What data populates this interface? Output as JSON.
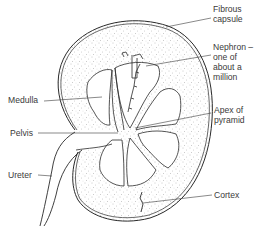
{
  "diagram": {
    "colors": {
      "line": "#2a2a2a",
      "stipple": "#8a8a8a",
      "text": "#3a3a3a",
      "background": "#ffffff"
    },
    "labels": {
      "fibrous_capsule": "Fibrous\ncapsule",
      "nephron": "Nephron –\none of\nabout a\nmillion",
      "medulla": "Medulla",
      "apex_of_pyramid": "Apex of\npyramid",
      "pelvis": "Pelvis",
      "ureter": "Ureter",
      "cortex": "Cortex"
    }
  }
}
